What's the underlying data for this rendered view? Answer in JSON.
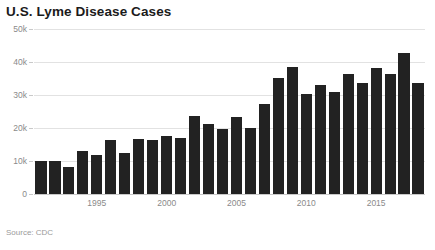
{
  "title": "U.S. Lyme Disease Cases",
  "source": "Source: CDC",
  "axis": {
    "y_ticks": [
      "0",
      "10k",
      "20k",
      "30k",
      "40k",
      "50k"
    ],
    "y_tick_values": [
      0,
      10000,
      20000,
      30000,
      40000,
      50000
    ],
    "x_ticks": [
      "1995",
      "2000",
      "2005",
      "2010",
      "2015"
    ],
    "x_tick_values": [
      1995,
      2000,
      2005,
      2010,
      2015
    ]
  },
  "colors": {
    "bar": "#222222",
    "grid": "#e2e2e2",
    "baseline": "#c9c9c9",
    "title": "#1b1b1b",
    "tick_label": "#8a8a8a",
    "source": "#9a9a9a",
    "background": "#ffffff"
  },
  "chart_data": {
    "type": "bar",
    "title": "U.S. Lyme Disease Cases",
    "xlabel": "",
    "ylabel": "",
    "ylim": [
      0,
      50000
    ],
    "grid": true,
    "legend": false,
    "categories": [
      "1991",
      "1992",
      "1993",
      "1994",
      "1995",
      "1996",
      "1997",
      "1998",
      "1999",
      "2000",
      "2001",
      "2002",
      "2003",
      "2004",
      "2005",
      "2006",
      "2007",
      "2008",
      "2009",
      "2010",
      "2011",
      "2012",
      "2013",
      "2014",
      "2015",
      "2016",
      "2017",
      "2018"
    ],
    "values": [
      9900,
      10000,
      8300,
      13000,
      11700,
      16500,
      12500,
      16800,
      16300,
      17700,
      17000,
      23700,
      21300,
      19800,
      23300,
      19900,
      27400,
      35200,
      38500,
      30200,
      33100,
      30800,
      36300,
      33500,
      38100,
      36400,
      42700,
      33700
    ],
    "value_labels_shown": false
  }
}
